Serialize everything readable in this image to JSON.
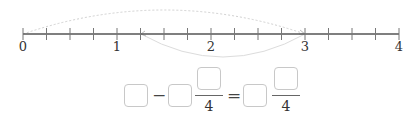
{
  "number_line": {
    "min": 0,
    "max": 4,
    "subdivisions_per_unit": 4,
    "labels": [
      "0",
      "1",
      "2",
      "3",
      "4"
    ],
    "arcs": [
      {
        "from": 0,
        "to": 3,
        "position": "above",
        "style": "dotted",
        "color": "#cfcfcf"
      },
      {
        "from": 3,
        "to": 1.25,
        "position": "below",
        "style": "solid",
        "color": "#dcdcdc"
      }
    ]
  },
  "equation": {
    "minus": "−",
    "equals": "=",
    "denominator_1": "4",
    "denominator_2": "4",
    "boxes": [
      {
        "id": "whole-1",
        "value": ""
      },
      {
        "id": "whole-2",
        "value": ""
      },
      {
        "id": "numerator-2",
        "value": ""
      },
      {
        "id": "whole-result",
        "value": ""
      },
      {
        "id": "numerator-result",
        "value": ""
      }
    ]
  },
  "colors": {
    "axis": "#555555",
    "box_border": "#c8c8c8",
    "arc": "#d0d0d0"
  }
}
